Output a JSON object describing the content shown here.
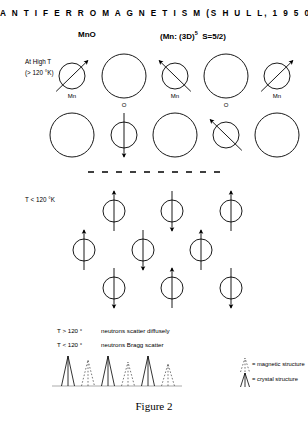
{
  "title": "A N T I F E R R O M A G N E T I S M   (S H U L L,   1 9 5 0-1)",
  "compound": "MnO",
  "config_prefix": "(Mn: (3D)",
  "config_sup": "5",
  "config_suffix": "S=5/2)",
  "high_temp": {
    "line1": "At High T",
    "line2": "(> 120 °K)"
  },
  "low_temp": {
    "label": "T < 120 °K"
  },
  "atom_labels": {
    "mn": "Mn",
    "o": "O"
  },
  "notes": [
    {
      "condition": "T > 120 °",
      "text": "neutrons scatter diffusely"
    },
    {
      "condition": "T < 120 °",
      "text": "neutrons Bragg scatter"
    }
  ],
  "legend": [
    {
      "marker": "dotted-peak-icon",
      "label": "= magnetic structure"
    },
    {
      "marker": "solid-peak-icon",
      "label": "= crystal structure"
    }
  ],
  "caption": "Figure 2",
  "colors": {
    "ink": "#000000",
    "light_ink": "#555555"
  },
  "diagram_data": {
    "type": "schematic",
    "high_temperature_rows": [
      {
        "row": 1,
        "y": 76,
        "atoms": [
          {
            "type": "Mn",
            "cx": 72,
            "r": 13,
            "spin": "up-right",
            "label": "Mn"
          },
          {
            "type": "O",
            "cx": 124,
            "r": 22,
            "spin": "none",
            "label": "O"
          },
          {
            "type": "Mn",
            "cx": 175,
            "r": 13,
            "spin": "up-left",
            "label": "Mn"
          },
          {
            "type": "O",
            "cx": 226,
            "r": 22,
            "spin": "none",
            "label": "O"
          },
          {
            "type": "Mn",
            "cx": 277,
            "r": 13,
            "spin": "up-right",
            "label": "Mn"
          }
        ]
      },
      {
        "row": 2,
        "y": 135,
        "atoms": [
          {
            "type": "O",
            "cx": 72,
            "r": 22,
            "spin": "none",
            "label": ""
          },
          {
            "type": "Mn",
            "cx": 124,
            "r": 13,
            "spin": "down",
            "label": ""
          },
          {
            "type": "O",
            "cx": 175,
            "r": 22,
            "spin": "none",
            "label": ""
          },
          {
            "type": "Mn",
            "cx": 226,
            "r": 13,
            "spin": "up-left",
            "label": ""
          },
          {
            "type": "O",
            "cx": 277,
            "r": 22,
            "spin": "none",
            "label": ""
          }
        ]
      }
    ],
    "divider": {
      "y": 172,
      "x1": 88,
      "x2": 228,
      "style": "dashed"
    },
    "low_temperature_rows": [
      {
        "row": 1,
        "y": 211,
        "atoms": [
          {
            "type": "Mn",
            "cx": 114,
            "r": 11,
            "spin": "up"
          },
          {
            "type": "Mn",
            "cx": 172,
            "r": 11,
            "spin": "down"
          },
          {
            "type": "Mn",
            "cx": 231,
            "r": 11,
            "spin": "up"
          }
        ]
      },
      {
        "row": 2,
        "y": 250,
        "atoms": [
          {
            "type": "Mn",
            "cx": 84,
            "r": 11,
            "spin": "up"
          },
          {
            "type": "Mn",
            "cx": 143,
            "r": 11,
            "spin": "down"
          },
          {
            "type": "Mn",
            "cx": 201,
            "r": 11,
            "spin": "up"
          }
        ]
      },
      {
        "row": 3,
        "y": 288,
        "atoms": [
          {
            "type": "Mn",
            "cx": 114,
            "r": 11,
            "spin": "down"
          },
          {
            "type": "Mn",
            "cx": 172,
            "r": 11,
            "spin": "up"
          },
          {
            "type": "Mn",
            "cx": 231,
            "r": 11,
            "spin": "down"
          }
        ]
      }
    ]
  },
  "chart_data": {
    "type": "line",
    "title": "",
    "xlabel": "",
    "ylabel": "",
    "grid": false,
    "legend_position": "right",
    "baseline_y": 386,
    "peaks": [
      {
        "x": 68,
        "height": 30,
        "kind": "crystal"
      },
      {
        "x": 88,
        "height": 26,
        "kind": "magnetic"
      },
      {
        "x": 108,
        "height": 30,
        "kind": "crystal"
      },
      {
        "x": 128,
        "height": 24,
        "kind": "magnetic"
      },
      {
        "x": 148,
        "height": 30,
        "kind": "crystal"
      },
      {
        "x": 168,
        "height": 22,
        "kind": "magnetic"
      }
    ],
    "series": [
      {
        "name": "crystal structure",
        "style": "solid",
        "values": [
          30,
          30,
          30
        ]
      },
      {
        "name": "magnetic structure",
        "style": "dotted",
        "values": [
          26,
          24,
          22
        ]
      }
    ]
  }
}
